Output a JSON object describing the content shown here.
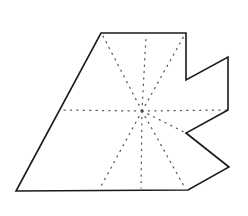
{
  "figure": {
    "caption": "",
    "background_color": "#ffffff",
    "canvas": {
      "width": 248,
      "height": 216
    }
  },
  "polygon": {
    "name": "star-shaped-polygon",
    "stroke_color": "#1a1a1a",
    "stroke_width": 1.6,
    "fill": "none",
    "vertex_count": 10,
    "vertices": [
      {
        "label": "v1",
        "x": 101,
        "y": 33
      },
      {
        "label": "v2",
        "x": 186,
        "y": 33
      },
      {
        "label": "v3",
        "x": 186,
        "y": 80
      },
      {
        "label": "v4",
        "x": 228,
        "y": 57
      },
      {
        "label": "v5",
        "x": 228,
        "y": 110
      },
      {
        "label": "v6",
        "x": 186,
        "y": 133
      },
      {
        "label": "v7",
        "x": 229,
        "y": 167
      },
      {
        "label": "v8",
        "x": 188,
        "y": 190
      },
      {
        "label": "v9",
        "x": 16,
        "y": 191
      },
      {
        "label": "v10",
        "x": 101,
        "y": 33
      }
    ],
    "path": "M101,33 L186,33 L186,80 L228,57 L228,110 L186,133 L229,167 L188,190 L16,191 Z"
  },
  "kernel_point": {
    "name": "kernel-center",
    "x": 142,
    "y": 111,
    "radius": 1.3,
    "color": "#4a4a4a"
  },
  "rays": {
    "name": "visibility-rays",
    "stroke_color": "#5a5a5a",
    "stroke_width": 1.25,
    "dash_pattern": "1.2 5.2",
    "count": 9,
    "segments": [
      {
        "label": "ray-to-left-edge",
        "x1": 142,
        "y1": 111,
        "x2": 60,
        "y2": 110
      },
      {
        "label": "ray-to-right-tip",
        "x1": 142,
        "y1": 111,
        "x2": 227,
        "y2": 110
      },
      {
        "label": "ray-to-v1",
        "x1": 142,
        "y1": 111,
        "x2": 103,
        "y2": 36
      },
      {
        "label": "ray-to-v2",
        "x1": 142,
        "y1": 111,
        "x2": 184,
        "y2": 36
      },
      {
        "label": "ray-to-top-mid",
        "x1": 142,
        "y1": 111,
        "x2": 146,
        "y2": 36
      },
      {
        "label": "ray-to-v9",
        "x1": 142,
        "y1": 111,
        "x2": 100,
        "y2": 188
      },
      {
        "label": "ray-to-bottom-mid",
        "x1": 142,
        "y1": 111,
        "x2": 141,
        "y2": 188
      },
      {
        "label": "ray-to-v8",
        "x1": 142,
        "y1": 111,
        "x2": 185,
        "y2": 188
      },
      {
        "label": "ray-to-v6-notch",
        "x1": 142,
        "y1": 111,
        "x2": 186,
        "y2": 133
      }
    ]
  }
}
